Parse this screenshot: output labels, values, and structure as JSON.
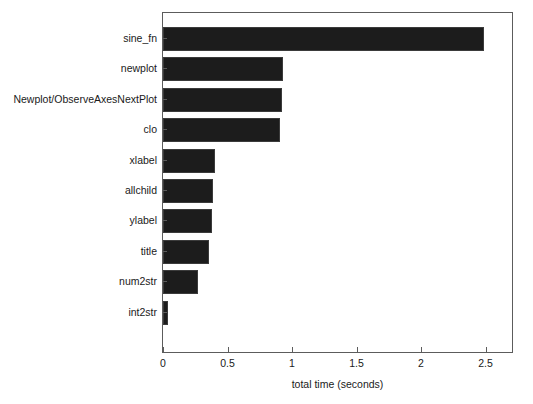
{
  "chart_data": {
    "type": "bar",
    "orientation": "horizontal",
    "title": "",
    "xlabel": "total time (seconds)",
    "ylabel": "",
    "categories": [
      "sine_fn",
      "newplot",
      "Newplot/ObserveAxesNextPlot",
      "clo",
      "xlabel",
      "allchild",
      "ylabel",
      "title",
      "num2str",
      "int2str"
    ],
    "values": [
      2.49,
      0.93,
      0.92,
      0.91,
      0.4,
      0.39,
      0.38,
      0.36,
      0.27,
      0.04
    ],
    "xlim": [
      0,
      2.705
    ],
    "xticks": [
      0,
      0.5,
      1,
      1.5,
      2,
      2.5
    ],
    "xtick_labels": [
      "0",
      "0.5",
      "1",
      "1.5",
      "2",
      "2.5"
    ],
    "grid": false,
    "legend": null,
    "bar_color": "#1c1c1c",
    "axis_color": "#5c5c5c",
    "background_color": "#ffffff"
  },
  "figure": {
    "background_color": "#ffffff",
    "axes_border_color": "#5c5c5c"
  }
}
